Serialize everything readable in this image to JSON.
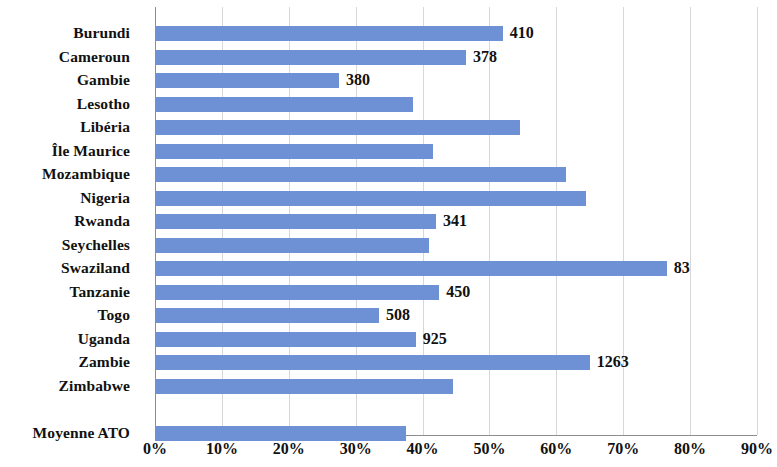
{
  "chart_data": {
    "type": "bar",
    "orientation": "horizontal",
    "title": "",
    "subtitle": "",
    "xlabel": "",
    "ylabel": "",
    "xlim": [
      0,
      90
    ],
    "xtick_labels": [
      "0%",
      "10%",
      "20%",
      "30%",
      "40%",
      "50%",
      "60%",
      "70%",
      "80%",
      "90%"
    ],
    "xtick_values": [
      0,
      10,
      20,
      30,
      40,
      50,
      60,
      70,
      80,
      90
    ],
    "grid": "vertical",
    "legend": "none",
    "bar_color": "#6d91d4",
    "axis_color": "#8d8d8d",
    "gridline_color": "#d7d7d7",
    "categories": [
      "Burundi",
      "Cameroun",
      "Gambie",
      "Lesotho",
      "Libéria",
      "Île Maurice",
      "Mozambique",
      "Nigeria",
      "Rwanda",
      "Seychelles",
      "Swaziland",
      "Tanzanie",
      "Togo",
      "Uganda",
      "Zambie",
      "Zimbabwe",
      "",
      "Moyenne ATO"
    ],
    "values": [
      52.0,
      46.5,
      27.5,
      38.5,
      54.5,
      41.5,
      61.5,
      64.5,
      42.0,
      41.0,
      76.5,
      42.5,
      33.5,
      39.0,
      65.0,
      44.5,
      null,
      37.5
    ],
    "data_labels": [
      "410",
      "378",
      "380",
      "",
      "",
      "",
      "",
      "",
      "341",
      "",
      "83",
      "450",
      "508",
      "925",
      "1263",
      "",
      "",
      ""
    ]
  }
}
